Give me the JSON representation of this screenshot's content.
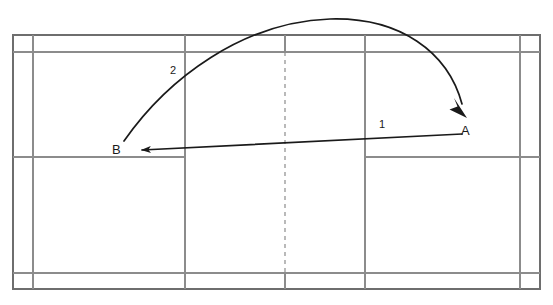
{
  "diagram": {
    "type": "court-diagram",
    "canvas": {
      "width": 553,
      "height": 305
    },
    "background_color": "#ffffff",
    "line_color": "#8c8c8c",
    "path_color": "#1a1a1a"
  },
  "labels": {
    "point_a": "A",
    "point_b": "B",
    "shot_one": "1",
    "shot_two": "2"
  },
  "court": {
    "outer_boundary": {
      "x1": 13,
      "y1": 35,
      "x2": 540,
      "y2": 289
    },
    "side_alley_left_x": 33,
    "side_alley_right_x": 520,
    "long_service_top_y": 52,
    "long_service_bottom_y": 273,
    "short_service_top_y": 157,
    "service_line_left_x": 185,
    "service_line_right_x": 365,
    "center_line_x": 285,
    "center_line_style": "dashed"
  },
  "shots": [
    {
      "id": "1",
      "label": "1",
      "kind": "straight-drive",
      "from": "A",
      "to": "B",
      "from_point": {
        "x": 462,
        "y": 134
      },
      "to_point": {
        "x": 133,
        "y": 150
      },
      "label_position": {
        "x": 379,
        "y": 120
      }
    },
    {
      "id": "2",
      "label": "2",
      "kind": "lob-curve",
      "from": "B",
      "to": "A",
      "from_point": {
        "x": 124,
        "y": 141
      },
      "to_point": {
        "x": 466,
        "y": 116
      },
      "apex": {
        "x": 337,
        "y": 20
      },
      "label_position": {
        "x": 170,
        "y": 66
      }
    }
  ],
  "points": [
    {
      "name": "A",
      "label": "A",
      "x": 462,
      "y": 125
    },
    {
      "name": "B",
      "label": "B",
      "x": 113,
      "y": 144
    }
  ]
}
